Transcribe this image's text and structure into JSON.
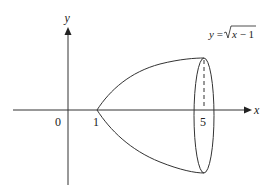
{
  "figure": {
    "type": "solid-of-revolution",
    "curve_label_prefix": "y = ",
    "curve_label_radical": "x − 1",
    "axes": {
      "x_label": "x",
      "y_label": "y"
    },
    "ticks": {
      "origin": "0",
      "left_bound": "1",
      "right_bound": "5"
    },
    "colors": {
      "stroke": "#333333",
      "background": "#ffffff"
    }
  }
}
